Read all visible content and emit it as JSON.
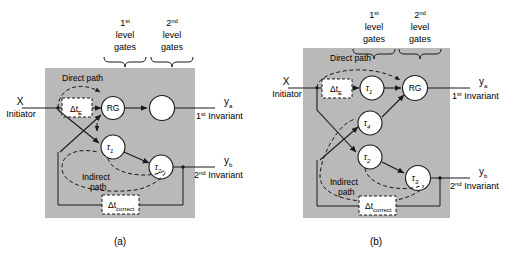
{
  "figure": {
    "title_absent": true,
    "panels": [
      {
        "id": "a",
        "caption": "(a)",
        "gate_groups": [
          {
            "num": "1",
            "sup": "st",
            "line2": "level",
            "line3": "gates"
          },
          {
            "num": "2",
            "sup": "nd",
            "line2": "level",
            "line3": "gates"
          }
        ],
        "input": {
          "symbol": "X",
          "label": "Initiator"
        },
        "outputs": [
          {
            "symbol": "y",
            "sub": "a",
            "num": "1",
            "sup": "st",
            "label": "Invariant"
          },
          {
            "symbol": "y",
            "sub": "b",
            "num": "2",
            "sup": "nd",
            "label": "Invariant"
          }
        ],
        "path_labels": {
          "direct": "Direct path",
          "indirect_l1": "Indirect",
          "indirect_l2": "path"
        },
        "delay_blocks": [
          {
            "name": "delta-t-e",
            "symbol": "Δt",
            "sub": "E"
          },
          {
            "name": "delta-t-correct",
            "symbol": "Δt",
            "sub": "correct"
          }
        ],
        "nodes": [
          {
            "name": "node-rg",
            "label": "RG",
            "sub": ""
          },
          {
            "name": "node-empty",
            "label": "",
            "sub": ""
          },
          {
            "name": "node-tau-1",
            "label": "τ",
            "sub": "1"
          },
          {
            "name": "node-tau-2",
            "label": "τ",
            "sub": "2"
          }
        ]
      },
      {
        "id": "b",
        "caption": "(b)",
        "gate_groups": [
          {
            "num": "1",
            "sup": "st",
            "line2": "level",
            "line3": "gates"
          },
          {
            "num": "2",
            "sup": "nd",
            "line2": "level",
            "line3": "gates"
          }
        ],
        "input": {
          "symbol": "X",
          "label": "Initiator"
        },
        "outputs": [
          {
            "symbol": "y",
            "sub": "a",
            "num": "1",
            "sup": "st",
            "label": "Invariant"
          },
          {
            "symbol": "y",
            "sub": "b",
            "num": "2",
            "sup": "nd",
            "label": "Invariant"
          }
        ],
        "path_labels": {
          "direct": "Direct path",
          "indirect_l1": "Indirect",
          "indirect_l2": "path"
        },
        "delay_blocks": [
          {
            "name": "delta-t-e",
            "symbol": "Δt",
            "sub": "E"
          },
          {
            "name": "delta-t-correct",
            "symbol": "Δt",
            "sub": "correct"
          }
        ],
        "nodes": [
          {
            "name": "node-tau-1",
            "label": "τ",
            "sub": "1"
          },
          {
            "name": "node-rg",
            "label": "RG",
            "sub": ""
          },
          {
            "name": "node-tau-4",
            "label": "τ",
            "sub": "4"
          },
          {
            "name": "node-tau-2",
            "label": "τ",
            "sub": "2"
          },
          {
            "name": "node-tau-3",
            "label": "τ",
            "sub": "3"
          }
        ]
      }
    ],
    "colors": {
      "background": "#ffffff",
      "panel_fill": "#b9b9b9",
      "stroke": "#1a1a1a",
      "node_fill": "#ffffff"
    }
  }
}
